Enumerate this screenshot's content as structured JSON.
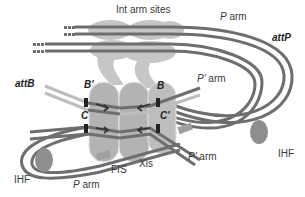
{
  "diagram": {
    "labels": {
      "int_arm_sites": "Int arm sites",
      "p_arm_top": "P arm",
      "p_arm_top_italic": "P",
      "p_arm_top_rest": " arm",
      "attP": "attP",
      "attB": "attB",
      "b_prime": "B'",
      "b": "B",
      "c": "C",
      "c_prime": "C'",
      "p_prime_arm_upper_italic": "P'",
      "p_prime_arm_upper_rest": " arm",
      "p_prime_arm_lower_italic": "P'",
      "p_prime_arm_lower_rest": " arm",
      "ihf_left": "IHF",
      "ihf_right": "IHF",
      "p_arm_bottom_italic": "P",
      "p_arm_bottom_rest": " arm",
      "fis": "FIS",
      "xis": "Xis"
    },
    "colors": {
      "dna_dark": "#6e6e6e",
      "dna_light": "#b9b9b9",
      "protein_light": "#c9c9c9",
      "protein_mid": "#a9a9a9",
      "ihf": "#8c8c8c",
      "fis": "#a3a3a3",
      "text": "#3a3a3a"
    }
  }
}
